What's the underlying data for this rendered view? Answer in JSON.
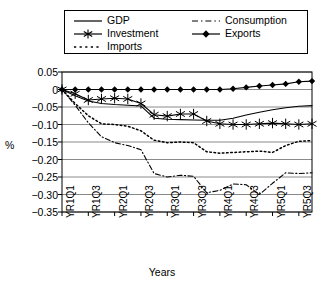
{
  "chart_data": {
    "type": "line",
    "title": "",
    "xlabel": "Years",
    "ylabel": "%",
    "ylim": [
      -0.35,
      0.05
    ],
    "yticks": [
      0.05,
      0,
      -0.05,
      -0.1,
      -0.15,
      -0.2,
      -0.25,
      -0.3,
      -0.35
    ],
    "ytick_labels": [
      "0.05",
      "0",
      "−0.05",
      "−0.10",
      "−0.15",
      "−0.20",
      "−0.25",
      "−0.30",
      "−0.35"
    ],
    "grid": true,
    "legend_position": "top",
    "x": [
      "YR1Q1",
      "YR1Q2",
      "YR1Q3",
      "YR1Q4",
      "YR2Q1",
      "YR2Q2",
      "YR2Q3",
      "YR2Q4",
      "YR3Q1",
      "YR3Q2",
      "YR3Q3",
      "YR3Q4",
      "YR4Q1",
      "YR4Q2",
      "YR4Q3",
      "YR4Q4",
      "YR5Q1",
      "YR5Q2",
      "YR5Q3",
      "YR5Q4"
    ],
    "xtick_labels": [
      "YR1Q1",
      "YR1Q3",
      "YR2Q1",
      "YR2Q3",
      "YR3Q1",
      "YR3Q3",
      "YR4Q1",
      "YR4Q3",
      "YR5Q1",
      "YR5Q3"
    ],
    "xtick_indices": [
      0,
      2,
      4,
      6,
      8,
      10,
      12,
      14,
      16,
      18
    ],
    "series": [
      {
        "name": "GDP",
        "style": "solid",
        "marker": "none",
        "color": "#000000",
        "values": [
          0.0,
          -0.018,
          -0.033,
          -0.04,
          -0.043,
          -0.045,
          -0.047,
          -0.082,
          -0.085,
          -0.086,
          -0.087,
          -0.088,
          -0.088,
          -0.082,
          -0.073,
          -0.065,
          -0.058,
          -0.052,
          -0.048,
          -0.046
        ]
      },
      {
        "name": "Investment",
        "style": "solid",
        "marker": "asterisk",
        "color": "#000000",
        "values": [
          0.0,
          -0.012,
          -0.03,
          -0.027,
          -0.025,
          -0.027,
          -0.04,
          -0.072,
          -0.076,
          -0.07,
          -0.07,
          -0.09,
          -0.098,
          -0.1,
          -0.1,
          -0.098,
          -0.096,
          -0.098,
          -0.1,
          -0.098
        ]
      },
      {
        "name": "Imports",
        "style": "dotted",
        "marker": "none",
        "color": "#000000",
        "values": [
          0.0,
          -0.04,
          -0.075,
          -0.098,
          -0.1,
          -0.105,
          -0.118,
          -0.145,
          -0.152,
          -0.15,
          -0.152,
          -0.178,
          -0.182,
          -0.18,
          -0.178,
          -0.176,
          -0.18,
          -0.16,
          -0.148,
          -0.146
        ]
      },
      {
        "name": "Consumption",
        "style": "dashdot",
        "marker": "none",
        "color": "#000000",
        "values": [
          0.0,
          -0.045,
          -0.095,
          -0.135,
          -0.152,
          -0.16,
          -0.172,
          -0.24,
          -0.25,
          -0.245,
          -0.248,
          -0.295,
          -0.288,
          -0.27,
          -0.272,
          -0.3,
          -0.268,
          -0.238,
          -0.24,
          -0.238
        ]
      },
      {
        "name": "Exports",
        "style": "solid",
        "marker": "diamond",
        "color": "#000000",
        "values": [
          0.0,
          0.0,
          0.0,
          0.0,
          0.0,
          0.0,
          0.0,
          0.0,
          0.0,
          0.0,
          0.0,
          0.0,
          0.0,
          0.002,
          0.006,
          0.01,
          0.013,
          0.016,
          0.022,
          0.024
        ]
      }
    ]
  },
  "legend": {
    "items": [
      {
        "label": "GDP"
      },
      {
        "label": "Investment"
      },
      {
        "label": "Imports"
      },
      {
        "label": "Consumption"
      },
      {
        "label": "Exports"
      }
    ]
  },
  "axes": {
    "y_axis_title": "%",
    "x_axis_title": "Years"
  }
}
